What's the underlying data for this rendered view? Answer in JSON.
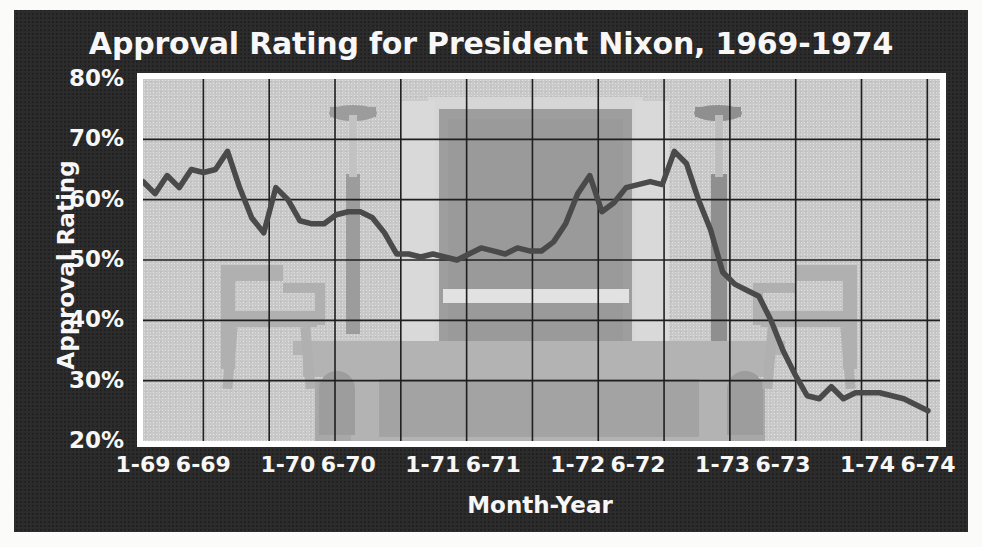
{
  "panel": {
    "background_color": "#2b2b2b",
    "plot_background_color": "#c9c9c9",
    "line_color": "#4a4a4a",
    "text_color": "#f7f7f7"
  },
  "title": "Approval Rating for President Nixon, 1969-1974",
  "axes": {
    "xlabel": "Month-Year",
    "ylabel": "Approval Rating"
  },
  "watermark": {
    "description": "oval-office-desk-and-chairs"
  },
  "chart_data": {
    "type": "line",
    "title": "Approval Rating for President Nixon, 1969-1974",
    "xlabel": "Month-Year",
    "ylabel": "Approval Rating",
    "xlim": [
      0,
      66
    ],
    "ylim": [
      20,
      80
    ],
    "yticks": [
      20,
      30,
      40,
      50,
      60,
      70,
      80
    ],
    "ytick_labels": [
      "20%",
      "30%",
      "40%",
      "50%",
      "60%",
      "70%",
      "80%"
    ],
    "xticks": [
      0,
      5,
      12,
      17,
      24,
      29,
      36,
      41,
      48,
      53,
      60,
      65
    ],
    "xtick_labels": [
      "1-69",
      "6-69",
      "1-70",
      "6-70",
      "1-71",
      "6-71",
      "1-72",
      "6-72",
      "1-73",
      "6-73",
      "1-74",
      "6-74"
    ],
    "grid": true,
    "legend": null,
    "series": [
      {
        "name": "Approval Rating",
        "color": "#4a4a4a",
        "x": [
          0,
          1,
          2,
          3,
          4,
          5,
          6,
          7,
          8,
          9,
          10,
          11,
          12,
          13,
          14,
          15,
          16,
          17,
          18,
          19,
          20,
          21,
          22,
          23,
          24,
          25,
          26,
          27,
          28,
          29,
          30,
          31,
          32,
          33,
          34,
          35,
          36,
          37,
          38,
          39,
          40,
          41,
          42,
          43,
          44,
          45,
          46,
          47,
          48,
          49,
          50,
          51,
          52,
          53,
          54,
          55,
          56,
          57,
          58,
          59,
          60,
          61,
          62,
          63,
          64,
          65
        ],
        "values": [
          63,
          61,
          64,
          62,
          65,
          64.5,
          65,
          68,
          62,
          57,
          54.5,
          62,
          60,
          56.5,
          56,
          56,
          57.5,
          58,
          58,
          57,
          54.5,
          51,
          51,
          50.5,
          51,
          50.5,
          50,
          51,
          52,
          51.5,
          51,
          52,
          51.5,
          51.5,
          53,
          56,
          61,
          64,
          58,
          59.5,
          62,
          62.5,
          63,
          62.5,
          68,
          66,
          60,
          55,
          48,
          46,
          45,
          44,
          40,
          35,
          31,
          27.5,
          27,
          29,
          27,
          28,
          28,
          28,
          27.5,
          27,
          26,
          25
        ]
      }
    ],
    "annotations": []
  }
}
